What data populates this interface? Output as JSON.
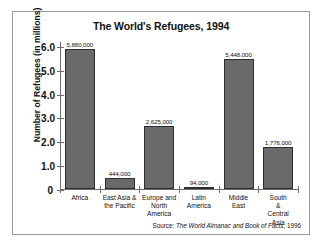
{
  "chart_data": {
    "type": "bar",
    "title": "The World's Refugees, 1994",
    "xlabel": "",
    "ylabel": "Number of Refugees (in millions)",
    "ylim": [
      0,
      6.2
    ],
    "ytick_labels": [
      "0",
      "1.0",
      "2.0",
      "3.0",
      "4.0",
      "5.0",
      "6.0"
    ],
    "ytick_values": [
      0,
      1.0,
      2.0,
      3.0,
      4.0,
      5.0,
      6.0
    ],
    "grid": false,
    "legend": "none",
    "categories": [
      "Africa",
      "East Asia &\nthe Pacific",
      "Europe and\nNorth\nAmerica",
      "Latin\nAmerica",
      "Middle\nEast",
      "South &\nCentral\nAsia"
    ],
    "values": [
      5.88,
      0.444,
      2.625,
      0.094,
      5.448,
      1.776
    ],
    "data_labels": [
      "5,880,000",
      "444,000",
      "2,625,000",
      "94,000",
      "5,448,000",
      "1,776,000"
    ],
    "bar_color": "#6a6a6a",
    "bar_edge_color": "#2e2e2e",
    "axis_color": "#6d6d6d"
  },
  "source": {
    "prefix": "Source: ",
    "publication": "The World Almanac and Book of Facts",
    "suffix": ", 1996"
  }
}
